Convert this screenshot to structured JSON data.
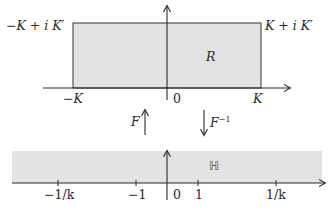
{
  "colors": {
    "shade": "#e3e3e3",
    "stroke": "#333333",
    "axis": "#2a2a2a",
    "text": "#2a2a2a"
  },
  "top_plane": {
    "region_label": "R",
    "corner_top_left": "−K + i K′",
    "corner_top_right": "K + i K′",
    "axis_labels": {
      "neg_K": "−K",
      "origin": "0",
      "pos_K": "K"
    }
  },
  "maps": {
    "forward": {
      "label": "F",
      "direction": "up"
    },
    "inverse": {
      "label": "F",
      "superscript": "−1",
      "direction": "down"
    }
  },
  "bottom_plane": {
    "region_label": "ℍ",
    "ticks": [
      {
        "label": "−1/k",
        "x": 58
      },
      {
        "label": "−1",
        "x": 136
      },
      {
        "label": "0",
        "x": 167
      },
      {
        "label": "1",
        "x": 198
      },
      {
        "label": "1/k",
        "x": 276
      }
    ]
  }
}
